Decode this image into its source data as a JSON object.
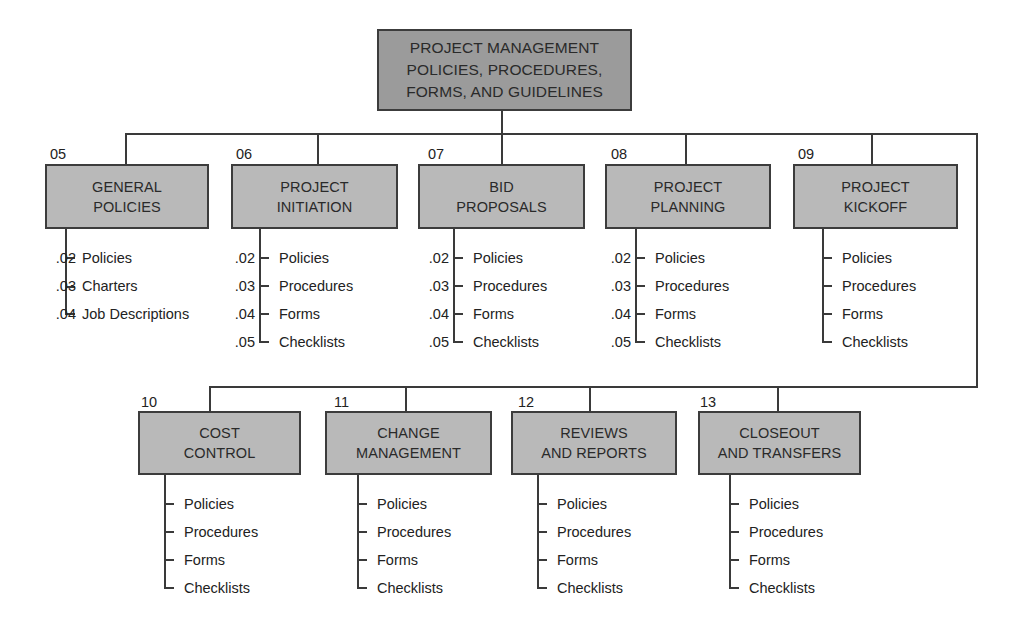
{
  "root": {
    "label": "PROJECT MANAGEMENT\nPOLICIES, PROCEDURES,\nFORMS, AND GUIDELINES"
  },
  "nodes": [
    {
      "code": "05",
      "label": "GENERAL\nPOLICIES",
      "items": [
        {
          "num": ".02",
          "label": "Policies"
        },
        {
          "num": ".03",
          "label": "Charters"
        },
        {
          "num": ".04",
          "label": "Job Descriptions"
        }
      ]
    },
    {
      "code": "06",
      "label": "PROJECT\nINITIATION",
      "items": [
        {
          "num": ".02",
          "label": "Policies"
        },
        {
          "num": ".03",
          "label": "Procedures"
        },
        {
          "num": ".04",
          "label": "Forms"
        },
        {
          "num": ".05",
          "label": "Checklists"
        }
      ]
    },
    {
      "code": "07",
      "label": "BID\nPROPOSALS",
      "items": [
        {
          "num": ".02",
          "label": "Policies"
        },
        {
          "num": ".03",
          "label": "Procedures"
        },
        {
          "num": ".04",
          "label": "Forms"
        },
        {
          "num": ".05",
          "label": "Checklists"
        }
      ]
    },
    {
      "code": "08",
      "label": "PROJECT\nPLANNING",
      "items": [
        {
          "num": ".02",
          "label": "Policies"
        },
        {
          "num": ".03",
          "label": "Procedures"
        },
        {
          "num": ".04",
          "label": "Forms"
        },
        {
          "num": ".05",
          "label": "Checklists"
        }
      ]
    },
    {
      "code": "09",
      "label": "PROJECT\nKICKOFF",
      "items": [
        {
          "num": "",
          "label": "Policies"
        },
        {
          "num": "",
          "label": "Procedures"
        },
        {
          "num": "",
          "label": "Forms"
        },
        {
          "num": "",
          "label": "Checklists"
        }
      ]
    },
    {
      "code": "10",
      "label": "COST\nCONTROL",
      "items": [
        {
          "num": "",
          "label": "Policies"
        },
        {
          "num": "",
          "label": "Procedures"
        },
        {
          "num": "",
          "label": "Forms"
        },
        {
          "num": "",
          "label": "Checklists"
        }
      ]
    },
    {
      "code": "11",
      "label": "CHANGE\nMANAGEMENT",
      "items": [
        {
          "num": "",
          "label": "Policies"
        },
        {
          "num": "",
          "label": "Procedures"
        },
        {
          "num": "",
          "label": "Forms"
        },
        {
          "num": "",
          "label": "Checklists"
        }
      ]
    },
    {
      "code": "12",
      "label": "REVIEWS\nAND REPORTS",
      "items": [
        {
          "num": "",
          "label": "Policies"
        },
        {
          "num": "",
          "label": "Procedures"
        },
        {
          "num": "",
          "label": "Forms"
        },
        {
          "num": "",
          "label": "Checklists"
        }
      ]
    },
    {
      "code": "13",
      "label": "CLOSEOUT\nAND TRANSFERS",
      "items": [
        {
          "num": "",
          "label": "Policies"
        },
        {
          "num": "",
          "label": "Procedures"
        },
        {
          "num": "",
          "label": "Forms"
        },
        {
          "num": "",
          "label": "Checklists"
        }
      ]
    }
  ],
  "colors": {
    "root_fill": "#9b9b9b",
    "box_fill": "#b9b9b9",
    "line": "#3a3a3a",
    "text": "#222222"
  }
}
